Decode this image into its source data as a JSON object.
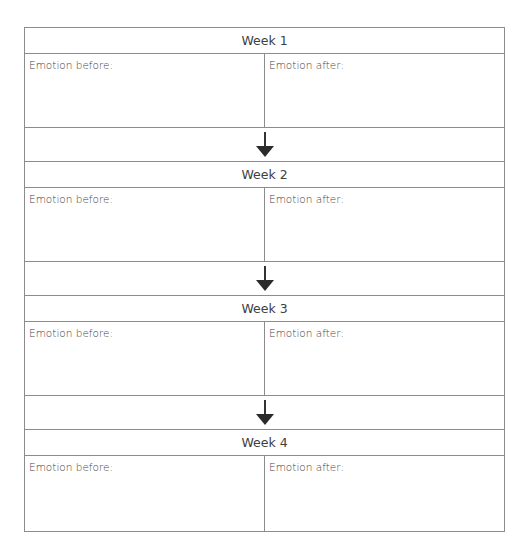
{
  "weeks": [
    {
      "title": "Week 1",
      "before_label": "Emotion before:",
      "after_label": "Emotion after:"
    },
    {
      "title": "Week 2",
      "before_label": "Emotion before:",
      "after_label": "Emotion after:"
    },
    {
      "title": "Week 3",
      "before_label": "Emotion before:",
      "after_label": "Emotion after:"
    },
    {
      "title": "Week 4",
      "before_label": "Emotion before:",
      "after_label": "Emotion after:"
    }
  ],
  "colors": {
    "border": "#8c8c8c",
    "arrow": "#2b2b2b",
    "text": "#404040"
  }
}
